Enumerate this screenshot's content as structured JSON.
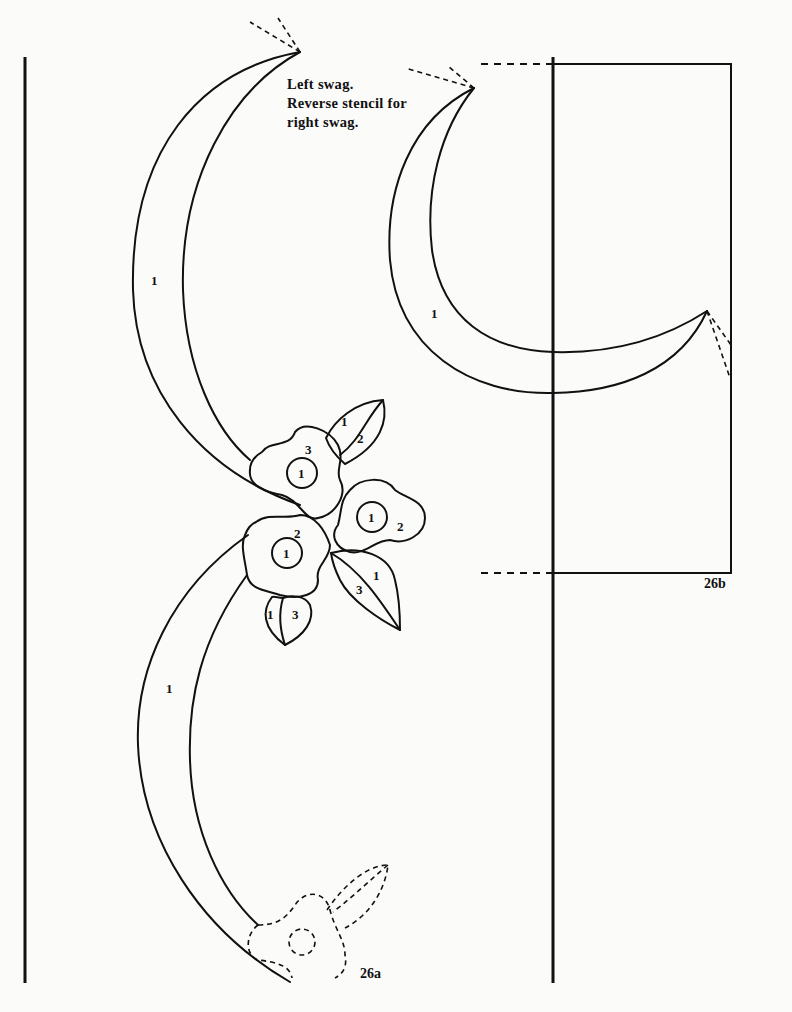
{
  "instructions": {
    "line1": "Left swag.",
    "line2": "Reverse stencil for",
    "line3": "right swag."
  },
  "figures": {
    "a": {
      "label": "26a"
    },
    "b": {
      "label": "26b"
    }
  },
  "stencil_numbers": {
    "swag_upper": "1",
    "swag_lower": "1",
    "swag_right": "1",
    "flower_top_center": "1",
    "flower_top_petal": "3",
    "leaf_top_a": "1",
    "leaf_top_b": "2",
    "flower_right_center": "1",
    "flower_right_petal": "2",
    "flower_lower_center": "1",
    "flower_lower_petal": "2",
    "leaf_right_a": "1",
    "leaf_right_b": "3",
    "bud_a": "1",
    "bud_b": "3"
  },
  "colors": {
    "paper": "#fbfbfa",
    "ink": "#111111"
  }
}
